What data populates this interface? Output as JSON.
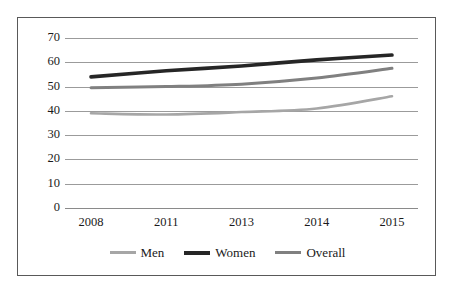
{
  "chart_data": {
    "type": "line",
    "title": "",
    "subtitle": "",
    "xlabel": "",
    "ylabel": "",
    "categories": [
      "2008",
      "2011",
      "2013",
      "2014",
      "2015"
    ],
    "ylim": [
      0,
      70
    ],
    "yticks": [
      "0",
      "10",
      "20",
      "30",
      "40",
      "50",
      "60",
      "70"
    ],
    "ytick_values": [
      0,
      10,
      20,
      30,
      40,
      50,
      60,
      70
    ],
    "grid": "horizontal",
    "legend_position": "bottom",
    "series": [
      {
        "name": "Men",
        "values": [
          39,
          38.5,
          39.5,
          41,
          46
        ],
        "color": "#a6a6a6",
        "width": 2.6
      },
      {
        "name": "Women",
        "values": [
          54,
          56.5,
          58.5,
          61,
          63
        ],
        "color": "#262626",
        "width": 3.6
      },
      {
        "name": "Overall",
        "values": [
          49.5,
          50,
          51,
          53.5,
          57.5
        ],
        "color": "#808080",
        "width": 3.0
      }
    ]
  },
  "colors": {
    "frame_border": "#595959",
    "gridline": "#9b9b9b",
    "text": "#1a1a1a",
    "background": "#ffffff",
    "men": "#a6a6a6",
    "women": "#262626",
    "overall": "#808080"
  },
  "legend": {
    "items": [
      {
        "label": "Men"
      },
      {
        "label": "Women"
      },
      {
        "label": "Overall"
      }
    ]
  }
}
